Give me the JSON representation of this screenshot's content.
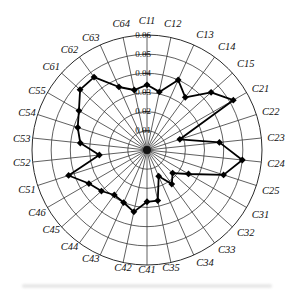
{
  "figure": {
    "background": "#ffffff",
    "grid_stroke": "#2b2b2b",
    "axis_stroke": "#151515"
  },
  "chart_data": {
    "type": "radar",
    "title": "",
    "legend": false,
    "grid": "polar-rings-and-spokes",
    "marker": "filled-diamond",
    "line_color": "#000000",
    "categories": [
      "C11",
      "C12",
      "C13",
      "C14",
      "C15",
      "C21",
      "C22",
      "C23",
      "C24",
      "C25",
      "C31",
      "C32",
      "C33",
      "C34",
      "C35",
      "C41",
      "C42",
      "C43",
      "C44",
      "C45",
      "C46",
      "C51",
      "C52",
      "C53",
      "C54",
      "C55",
      "C61",
      "C62",
      "C63",
      "C64"
    ],
    "series": [
      {
        "name": "criteria-weights",
        "values": [
          0.034,
          0.031,
          0.04,
          0.034,
          0.045,
          0.052,
          0.018,
          0.038,
          0.05,
          0.042,
          0.025,
          0.018,
          0.022,
          0.015,
          0.027,
          0.027,
          0.033,
          0.03,
          0.029,
          0.032,
          0.035,
          0.043,
          0.025,
          0.035,
          0.038,
          0.041,
          0.047,
          0.047,
          0.036,
          0.032
        ]
      }
    ],
    "r_axis": {
      "min": 0,
      "max": 0.06,
      "tick_step": 0.01,
      "tick_labels": [
        "0.01",
        "0.02",
        "0.03",
        "0.04",
        "0.05",
        "0.06"
      ]
    }
  }
}
